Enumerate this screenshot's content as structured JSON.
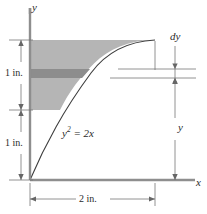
{
  "figure": {
    "background_color": "#ffffff",
    "line_color": "#4a4a4a",
    "text_color": "#2b2b2b",
    "shade_color": "#b3b3b3",
    "strip_color": "#8a8a8a",
    "width": 207,
    "height": 214
  },
  "axes": {
    "y_label": "y",
    "x_label": "x",
    "origin": {
      "x": 30,
      "y": 180
    }
  },
  "curve": {
    "equation_text": "y",
    "equation_exponent": "2",
    "equation_rest": " = 2x",
    "equation_full": "y² = 2x",
    "x_start": 0,
    "x_end": 2,
    "y_start": 0,
    "y_end": 2
  },
  "dimensions": {
    "left_upper": {
      "label": "1 in.",
      "value": 1,
      "unit": "in."
    },
    "left_lower": {
      "label": "1 in.",
      "value": 1,
      "unit": "in."
    },
    "bottom": {
      "label": "2 in.",
      "value": 2,
      "unit": "in."
    },
    "right_y": {
      "label": "y"
    },
    "element_thickness": {
      "label": "dy"
    }
  },
  "shaded_region": {
    "description": "area between y-axis and parabola from y = 1 in. to y = 2 in.",
    "y_top": 2,
    "y_bottom": 1
  },
  "strip_element": {
    "description": "differential horizontal strip of thickness dy"
  }
}
